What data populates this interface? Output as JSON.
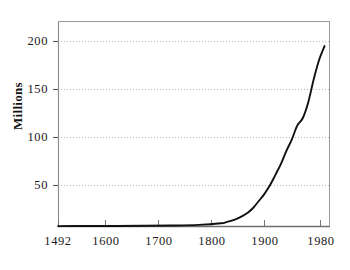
{
  "chart_data": {
    "type": "line",
    "title": "",
    "subtitle": "",
    "xlabel": "",
    "ylabel": "Millions",
    "xlim": [
      1492,
      1990
    ],
    "ylim": [
      0,
      225
    ],
    "grid": "horizontal-dotted",
    "legend": "none",
    "x_ticks": [
      1492,
      1600,
      1700,
      1800,
      1900,
      1980
    ],
    "x_tick_labels": [
      "1492",
      "1600",
      "1700",
      "1800",
      "1900",
      "1980"
    ],
    "y_ticks": [
      50,
      100,
      150,
      200
    ],
    "y_tick_labels": [
      "50",
      "100",
      "150",
      "200"
    ],
    "series": [
      {
        "name": "Population",
        "x": [
          1492,
          1550,
          1600,
          1650,
          1700,
          1750,
          1790,
          1800,
          1810,
          1820,
          1830,
          1840,
          1850,
          1860,
          1870,
          1880,
          1890,
          1900,
          1910,
          1920,
          1930,
          1940,
          1950,
          1960,
          1970,
          1980
        ],
        "values": [
          0.5,
          0.6,
          0.7,
          0.9,
          1.2,
          2.0,
          3.9,
          5.3,
          7.2,
          9.6,
          12.9,
          17.1,
          23.2,
          31.4,
          39.8,
          50.2,
          62.9,
          76.0,
          92.0,
          106.0,
          123.0,
          132.0,
          151.0,
          179.0,
          203.0,
          220.0
        ]
      }
    ],
    "line_color": "#111111",
    "grid_color": "#b9b9b9",
    "axis_color": "#7a7a7a",
    "end_value": 220
  },
  "axes": {
    "y_label": "Millions"
  }
}
